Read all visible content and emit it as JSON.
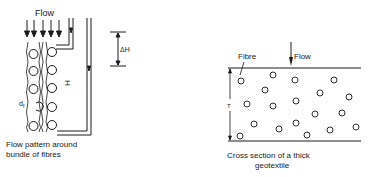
{
  "left_figure": {
    "flow_label": "Flow",
    "fibre_diameter_label": "d",
    "fibre_diameter_subscript": "f",
    "height_label": "H",
    "head_diff_label": "ΔH",
    "caption_line1": "Flow pattern around",
    "caption_line2": "bundle of fibres"
  },
  "right_figure": {
    "fibre_label": "Fibre",
    "flow_label": "Flow",
    "thickness_label": "T",
    "caption_line1": "Cross section of a thick",
    "caption_line2": "geotextile"
  },
  "colors": {
    "ink": "#1a1a1a",
    "background": "#ffffff"
  }
}
